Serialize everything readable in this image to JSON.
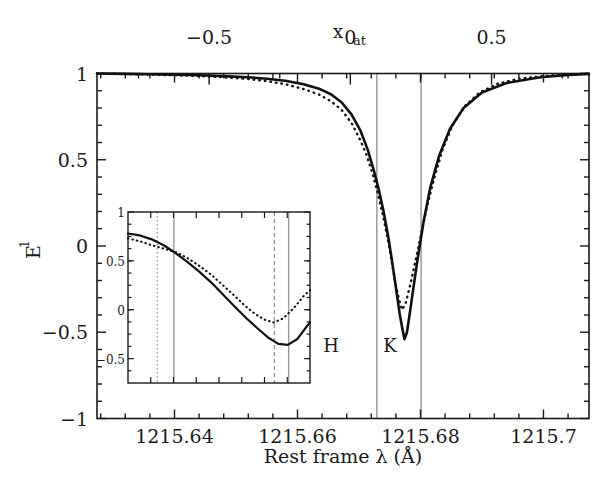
{
  "figure": {
    "background": "#ffffff",
    "foreground": "#1a1a1a",
    "marker_color": "#9a9a9a"
  },
  "chart_data": {
    "type": "line",
    "title": "",
    "xlabel": "Rest frame λ (Å)",
    "ylabel": "E",
    "ylabel_sub": "1",
    "top_axis_label": "x",
    "top_axis_label_sub": "at",
    "xlim": [
      1215.6274,
      1215.7074
    ],
    "ylim": [
      -1,
      1
    ],
    "top_xlim": [
      -0.897,
      0.845
    ],
    "grid": false,
    "legend_position": "none",
    "x_ticks": [
      "1215.64",
      "1215.66",
      "1215.68",
      "1215.7"
    ],
    "x_tick_values": [
      1215.64,
      1215.66,
      1215.68,
      1215.7
    ],
    "x_minor_count": 4,
    "y_ticks": [
      "1",
      "0.5",
      "0",
      "-0.5",
      "-1"
    ],
    "y_tick_values": [
      1,
      0.5,
      0,
      -0.5,
      -1
    ],
    "y_minor_count": 4,
    "top_ticks": [
      "-0.5",
      "0",
      "0.5"
    ],
    "top_tick_values": [
      -0.5,
      0,
      0.5
    ],
    "annotations": [
      {
        "name": "H",
        "label": "H",
        "x": 1215.6729,
        "color": "#9a9a9a",
        "style": "solid"
      },
      {
        "name": "K",
        "label": "K",
        "x": 1215.6801,
        "color": "#9a9a9a",
        "style": "solid"
      }
    ],
    "series": [
      {
        "name": "solid-curve",
        "style": "solid",
        "color": "#111111",
        "x": [
          1215.6274,
          1215.632,
          1215.636,
          1215.64,
          1215.644,
          1215.648,
          1215.652,
          1215.655,
          1215.658,
          1215.661,
          1215.6635,
          1215.6655,
          1215.6672,
          1215.6688,
          1215.6702,
          1215.6714,
          1215.6724,
          1215.6732,
          1215.674,
          1215.6747,
          1215.6753,
          1215.6758,
          1215.6762,
          1215.6766,
          1215.677,
          1215.6774,
          1215.6778,
          1215.6783,
          1215.6789,
          1215.6796,
          1215.6805,
          1215.6816,
          1215.683,
          1215.6848,
          1215.687,
          1215.69,
          1215.694,
          1215.699,
          1215.7,
          1215.704,
          1215.7074
        ],
        "y": [
          1.0,
          0.998,
          0.996,
          0.993,
          0.99,
          0.985,
          0.978,
          0.97,
          0.958,
          0.938,
          0.912,
          0.878,
          0.832,
          0.762,
          0.672,
          0.56,
          0.44,
          0.33,
          0.2,
          0.065,
          -0.07,
          -0.19,
          -0.29,
          -0.39,
          -0.47,
          -0.54,
          -0.5,
          -0.38,
          -0.23,
          -0.06,
          0.14,
          0.34,
          0.52,
          0.68,
          0.8,
          0.89,
          0.945,
          0.975,
          0.98,
          0.992,
          0.998
        ]
      },
      {
        "name": "dotted-curve",
        "style": "dotted",
        "color": "#111111",
        "x": [
          1215.6274,
          1215.632,
          1215.636,
          1215.64,
          1215.644,
          1215.648,
          1215.652,
          1215.655,
          1215.658,
          1215.661,
          1215.6635,
          1215.6655,
          1215.6672,
          1215.6688,
          1215.67,
          1215.6712,
          1215.6722,
          1215.6731,
          1215.674,
          1215.6748,
          1215.6754,
          1215.676,
          1215.6765,
          1215.677,
          1215.6776,
          1215.6783,
          1215.6791,
          1215.68,
          1215.681,
          1215.6822,
          1215.6836,
          1215.6852,
          1215.6872,
          1215.6896,
          1215.6925,
          1215.696,
          1215.7,
          1215.704,
          1215.7074
        ],
        "y": [
          1.0,
          0.997,
          0.994,
          0.99,
          0.985,
          0.978,
          0.968,
          0.956,
          0.938,
          0.91,
          0.878,
          0.838,
          0.788,
          0.712,
          0.63,
          0.53,
          0.42,
          0.3,
          0.16,
          0.02,
          -0.11,
          -0.23,
          -0.31,
          -0.37,
          -0.33,
          -0.23,
          -0.1,
          0.05,
          0.22,
          0.39,
          0.56,
          0.7,
          0.81,
          0.89,
          0.94,
          0.97,
          0.985,
          0.994,
          0.999
        ]
      }
    ]
  },
  "inset": {
    "name": "inset-panel",
    "xlim": [
      1215.638,
      1215.661
    ],
    "ylim": [
      -0.75,
      1.0
    ],
    "y_ticks": [
      "1",
      "0.5",
      "0",
      "-0.5"
    ],
    "y_tick_values": [
      1,
      0.5,
      0,
      -0.5
    ],
    "x_minor_count": 8,
    "y_minor_count": 4,
    "markers": [
      {
        "name": "inset-marker-1",
        "x": 1215.6417,
        "style": "dotted",
        "color": "#9a9a9a"
      },
      {
        "name": "inset-marker-2",
        "x": 1215.6438,
        "style": "solid",
        "color": "#9a9a9a"
      },
      {
        "name": "inset-marker-3",
        "x": 1215.6565,
        "style": "dashed",
        "color": "#9a9a9a"
      },
      {
        "name": "inset-marker-4",
        "x": 1215.6583,
        "style": "solid",
        "color": "#9a9a9a"
      }
    ],
    "series": [
      {
        "name": "inset-solid-curve",
        "style": "solid",
        "color": "#111111",
        "x": [
          1215.638,
          1215.6395,
          1215.641,
          1215.6425,
          1215.644,
          1215.6455,
          1215.647,
          1215.6485,
          1215.65,
          1215.6515,
          1215.653,
          1215.6545,
          1215.6558,
          1215.657,
          1215.6582,
          1215.6594,
          1215.6605,
          1215.661
        ],
        "y": [
          0.78,
          0.76,
          0.72,
          0.66,
          0.58,
          0.49,
          0.39,
          0.28,
          0.155,
          0.03,
          -0.09,
          -0.2,
          -0.29,
          -0.35,
          -0.36,
          -0.3,
          -0.18,
          -0.13
        ]
      },
      {
        "name": "inset-dotted-curve",
        "style": "dotted",
        "color": "#111111",
        "x": [
          1215.638,
          1215.6395,
          1215.641,
          1215.6425,
          1215.644,
          1215.6455,
          1215.647,
          1215.6485,
          1215.65,
          1215.6515,
          1215.6528,
          1215.654,
          1215.6552,
          1215.6564,
          1215.6576,
          1215.659,
          1215.6602,
          1215.661
        ],
        "y": [
          0.73,
          0.7,
          0.66,
          0.625,
          0.59,
          0.53,
          0.45,
          0.36,
          0.25,
          0.14,
          0.04,
          -0.04,
          -0.1,
          -0.13,
          -0.09,
          0.02,
          0.14,
          0.2
        ]
      }
    ]
  }
}
